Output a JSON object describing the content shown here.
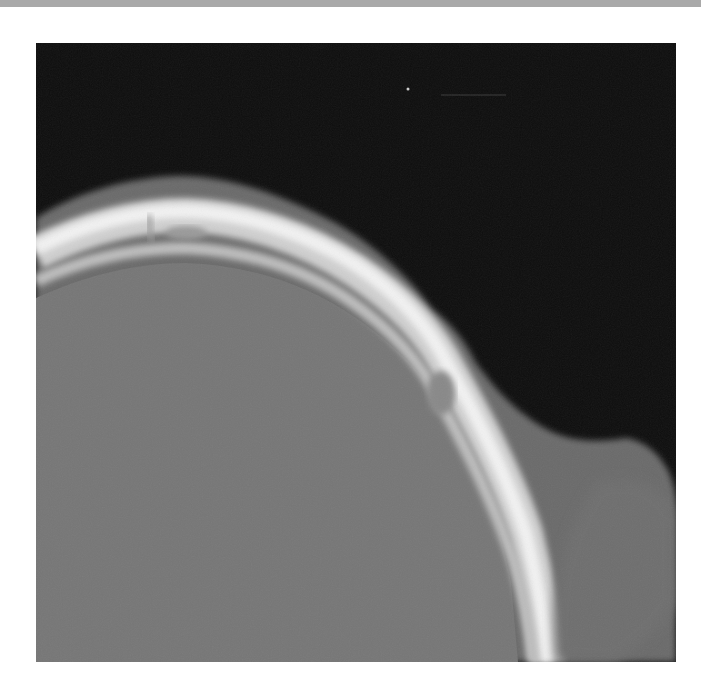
{
  "image": {
    "subject": "CT scan, axial slice of skull (bone window)",
    "colors": {
      "background": "#0d0d0d",
      "soft_tissue": "#6e6e6e",
      "brain": "#777777",
      "bone": "#e8e8e8",
      "top_bar": "#a9a9a9",
      "page": "#ffffff"
    }
  }
}
